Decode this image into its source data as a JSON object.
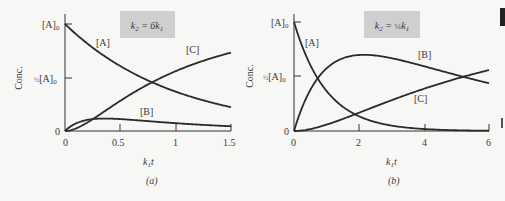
{
  "chart_data": [
    {
      "type": "line",
      "panel_label": "(a)",
      "title": "k2 = 6k1",
      "xlabel": "k1 t",
      "ylabel": "Conc.",
      "x_ticks": [
        "0",
        "0.5",
        "1",
        "1.5"
      ],
      "x_tick_values": [
        0,
        0.5,
        1,
        1.5
      ],
      "y_ticks": [
        "0",
        "1/2 [A]0",
        "[A]0"
      ],
      "y_tick_values": [
        0,
        0.5,
        1
      ],
      "xlim": [
        0,
        1.5
      ],
      "ylim": [
        0,
        1
      ],
      "grid": false,
      "legend": "inline labels",
      "x": [
        0,
        0.1,
        0.2,
        0.3,
        0.4,
        0.5,
        0.6,
        0.7,
        0.8,
        0.9,
        1.0,
        1.1,
        1.2,
        1.3,
        1.4,
        1.5
      ],
      "series": [
        {
          "name": "[A]",
          "values": [
            1.0,
            0.905,
            0.819,
            0.741,
            0.67,
            0.607,
            0.549,
            0.497,
            0.449,
            0.407,
            0.368,
            0.333,
            0.301,
            0.273,
            0.247,
            0.223
          ]
        },
        {
          "name": "[B]",
          "values": [
            0.0,
            0.071,
            0.104,
            0.115,
            0.116,
            0.111,
            0.105,
            0.098,
            0.089,
            0.081,
            0.073,
            0.066,
            0.06,
            0.054,
            0.049,
            0.045
          ]
        },
        {
          "name": "[C]",
          "values": [
            0.0,
            0.024,
            0.077,
            0.144,
            0.214,
            0.282,
            0.346,
            0.405,
            0.462,
            0.512,
            0.559,
            0.601,
            0.639,
            0.673,
            0.704,
            0.732
          ]
        }
      ],
      "series_labels": [
        "[A]",
        "[B]",
        "[C]"
      ]
    },
    {
      "type": "line",
      "panel_label": "(b)",
      "title": "k2 = 1/6 k1",
      "xlabel": "k1 t",
      "ylabel": "Conc.",
      "x_ticks": [
        "0",
        "2",
        "4",
        "6"
      ],
      "x_tick_values": [
        0,
        2,
        4,
        6
      ],
      "y_ticks": [
        "0",
        "1/2 [A]0",
        "[A]0"
      ],
      "y_tick_values": [
        0,
        0.5,
        1
      ],
      "xlim": [
        0,
        6
      ],
      "ylim": [
        0,
        1
      ],
      "grid": false,
      "legend": "inline labels",
      "x": [
        0,
        0.25,
        0.5,
        0.75,
        1,
        1.5,
        2,
        2.5,
        3,
        3.5,
        4,
        4.5,
        5,
        5.5,
        6
      ],
      "series": [
        {
          "name": "[A]",
          "values": [
            1.0,
            0.779,
            0.607,
            0.472,
            0.368,
            0.223,
            0.135,
            0.082,
            0.05,
            0.03,
            0.018,
            0.011,
            0.007,
            0.004,
            0.002
          ]
        },
        {
          "name": "[B]",
          "values": [
            0.0,
            0.204,
            0.349,
            0.45,
            0.574,
            0.667,
            0.697,
            0.693,
            0.669,
            0.636,
            0.594,
            0.551,
            0.514,
            0.475,
            0.439
          ]
        },
        {
          "name": "[C]",
          "values": [
            0.0,
            0.017,
            0.044,
            0.078,
            0.058,
            0.11,
            0.168,
            0.225,
            0.281,
            0.334,
            0.388,
            0.438,
            0.479,
            0.521,
            0.559
          ]
        }
      ],
      "series_labels": [
        "[A]",
        "[B]",
        "[C]"
      ]
    }
  ],
  "panels": {
    "a": {
      "caption": "(a)",
      "k_label": "k2 = 6k1"
    },
    "b": {
      "caption": "(b)",
      "k_label": "k2 = 1/6 k1"
    }
  }
}
